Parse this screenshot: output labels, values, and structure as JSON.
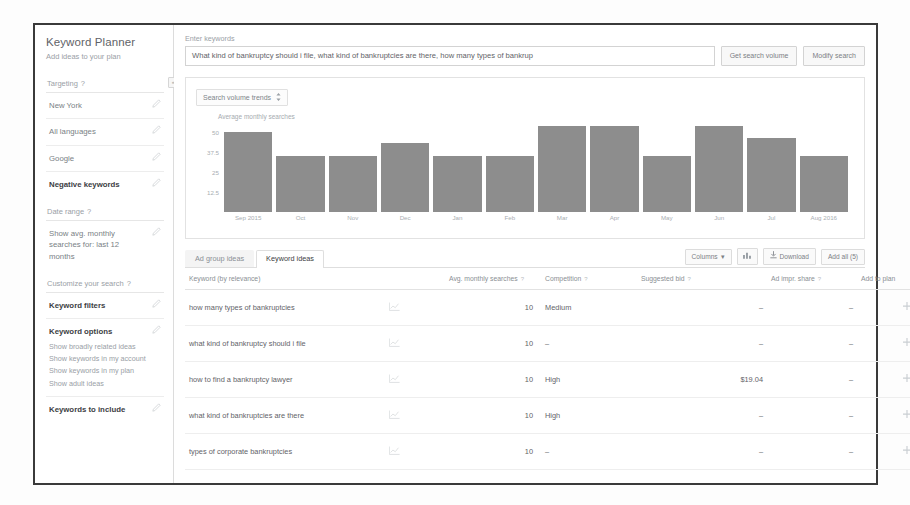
{
  "app": {
    "title": "Keyword Planner",
    "subtitle": "Add ideas to your plan"
  },
  "sidebar": {
    "collapse_icon": "«",
    "sections": [
      {
        "label": "Targeting",
        "info_icon": "?",
        "rows": [
          {
            "text": "New York",
            "strong": false
          },
          {
            "text": "All languages",
            "strong": false
          },
          {
            "text": "Google",
            "strong": false
          },
          {
            "text": "Negative keywords",
            "strong": true
          }
        ]
      },
      {
        "label": "Date range",
        "info_icon": "?",
        "rows": [
          {
            "text": "Show avg. monthly searches for: last 12 months",
            "strong": false
          }
        ]
      },
      {
        "label": "Customize your search",
        "info_icon": "?",
        "rows": [
          {
            "text": "Keyword filters",
            "strong": true
          }
        ]
      }
    ],
    "keyword_options": {
      "title": "Keyword options",
      "items": [
        "Show broadly related ideas",
        "Show keywords in my account",
        "Show keywords in my plan",
        "Show adult ideas"
      ]
    },
    "keywords_to_include": "Keywords to include"
  },
  "search": {
    "label": "Enter keywords",
    "value": "What kind of bankruptcy should i file, what kind of bankruptcies are there, how many types of bankrup",
    "placeholder": "Enter keywords",
    "get_volume_label": "Get search volume",
    "modify_search_label": "Modify search"
  },
  "chart_card": {
    "select_label": "Search volume trends",
    "select_icon": "chevron-updown-icon",
    "ylabel": "Average monthly searches"
  },
  "chart_data": {
    "type": "bar",
    "title": "Search volume trends",
    "xlabel": "",
    "ylabel": "Average monthly searches",
    "categories": [
      "Sep 2015",
      "Oct",
      "Nov",
      "Dec",
      "Jan",
      "Feb",
      "Mar",
      "Apr",
      "May",
      "Jun",
      "Jul",
      "Aug 2016"
    ],
    "values": [
      50,
      35,
      35,
      43,
      35,
      35,
      54,
      54,
      35,
      54,
      46,
      35
    ],
    "ylim": [
      0,
      56.25
    ],
    "yticks": [
      50,
      37.5,
      25,
      12.5
    ],
    "ytick_labels": [
      "50",
      "37.5",
      "25",
      "12.5"
    ],
    "grid": false,
    "legend": "none",
    "bar_color": "#8d8d8d"
  },
  "tabs": [
    {
      "label": "Ad group ideas",
      "active": false
    },
    {
      "label": "Keyword ideas",
      "active": true
    }
  ],
  "toolbar": {
    "columns_label": "Columns",
    "columns_caret": "▾",
    "graph_icon": "bar-chart-icon",
    "download_icon": "download-icon",
    "download_label": "Download",
    "add_all_label": "Add all (5)"
  },
  "table": {
    "headers": [
      {
        "label": "Keyword (by relevance)",
        "sort": ""
      },
      {
        "label": "",
        "sort": ""
      },
      {
        "label": "Avg. monthly searches",
        "sort": "?"
      },
      {
        "label": "Competition",
        "sort": "?"
      },
      {
        "label": "Suggested bid",
        "sort": "?"
      },
      {
        "label": "Ad impr. share",
        "sort": "?"
      },
      {
        "label": "Add to plan",
        "sort": ""
      }
    ],
    "rows": [
      {
        "keyword": "how many types of bankruptcies",
        "trend_icon": "trend-graph-icon",
        "avg_monthly_searches": "10",
        "competition": "Medium",
        "suggested_bid": "–",
        "ad_impr_share": "–",
        "add_icon": "add-to-plan-icon"
      },
      {
        "keyword": "what kind of bankruptcy should i file",
        "trend_icon": "trend-graph-icon",
        "avg_monthly_searches": "10",
        "competition": "–",
        "suggested_bid": "–",
        "ad_impr_share": "–",
        "add_icon": "add-to-plan-icon"
      },
      {
        "keyword": "how to find a bankruptcy lawyer",
        "trend_icon": "trend-graph-icon",
        "avg_monthly_searches": "10",
        "competition": "High",
        "suggested_bid": "$19.04",
        "ad_impr_share": "–",
        "add_icon": "add-to-plan-icon"
      },
      {
        "keyword": "what kind of bankruptcies are there",
        "trend_icon": "trend-graph-icon",
        "avg_monthly_searches": "10",
        "competition": "High",
        "suggested_bid": "–",
        "ad_impr_share": "–",
        "add_icon": "add-to-plan-icon"
      },
      {
        "keyword": "types of corporate bankruptcies",
        "trend_icon": "trend-graph-icon",
        "avg_monthly_searches": "10",
        "competition": "–",
        "suggested_bid": "–",
        "ad_impr_share": "–",
        "add_icon": "add-to-plan-icon"
      }
    ]
  }
}
